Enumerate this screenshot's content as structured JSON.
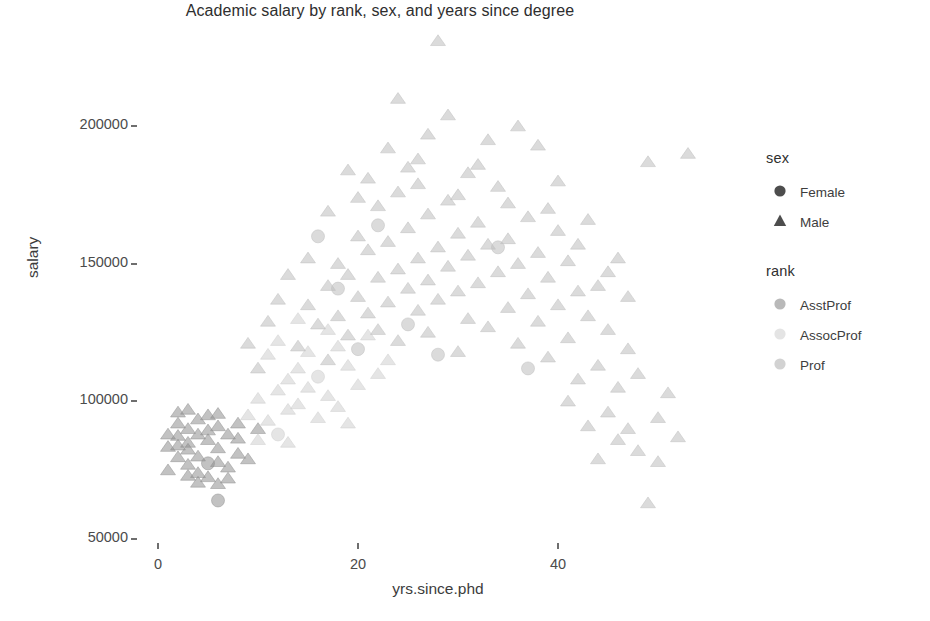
{
  "chart_data": {
    "type": "scatter",
    "title": "Academic salary by rank, sex, and years since degree",
    "xlabel": "yrs.since.phd",
    "ylabel": "salary",
    "xlim": [
      -2,
      58
    ],
    "ylim": [
      46000,
      235000
    ],
    "grid": false,
    "x_ticks": [
      {
        "value": 0,
        "label": "0"
      },
      {
        "value": 20,
        "label": "20"
      },
      {
        "value": 40,
        "label": "40"
      }
    ],
    "y_ticks": [
      {
        "value": 50000,
        "label": "50000"
      },
      {
        "value": 100000,
        "label": "100000"
      },
      {
        "value": 150000,
        "label": "150000"
      },
      {
        "value": 200000,
        "label": "200000"
      }
    ],
    "legends": [
      {
        "title": "sex",
        "encoding": "shape",
        "entries": [
          {
            "label": "Female",
            "shape": "circle",
            "color": "#4d4d4d"
          },
          {
            "label": "Male",
            "shape": "triangle",
            "color": "#4d4d4d"
          }
        ]
      },
      {
        "title": "rank",
        "encoding": "color",
        "entries": [
          {
            "label": "AsstProf",
            "shape": "circle",
            "color": "#b9b9b9"
          },
          {
            "label": "AssocProf",
            "shape": "circle",
            "color": "#e4e4e4"
          },
          {
            "label": "Prof",
            "shape": "circle",
            "color": "#d2d2d2"
          }
        ]
      }
    ],
    "marker_opacity": 0.55,
    "marker_size": 13,
    "series": [
      {
        "name": "AsstProf",
        "color": "#8f8f8f",
        "points": [
          {
            "x": 1,
            "y": 88000,
            "sex": "Male"
          },
          {
            "x": 2,
            "y": 79750,
            "sex": "Male"
          },
          {
            "x": 2,
            "y": 92000,
            "sex": "Male"
          },
          {
            "x": 3,
            "y": 85000,
            "sex": "Male"
          },
          {
            "x": 3,
            "y": 77000,
            "sex": "Male"
          },
          {
            "x": 3,
            "y": 90000,
            "sex": "Male"
          },
          {
            "x": 4,
            "y": 74000,
            "sex": "Male"
          },
          {
            "x": 4,
            "y": 88000,
            "sex": "Male"
          },
          {
            "x": 4,
            "y": 80000,
            "sex": "Male"
          },
          {
            "x": 5,
            "y": 72500,
            "sex": "Male"
          },
          {
            "x": 5,
            "y": 86000,
            "sex": "Male"
          },
          {
            "x": 5,
            "y": 95000,
            "sex": "Male"
          },
          {
            "x": 5,
            "y": 77500,
            "sex": "Female"
          },
          {
            "x": 6,
            "y": 83000,
            "sex": "Male"
          },
          {
            "x": 6,
            "y": 91000,
            "sex": "Male"
          },
          {
            "x": 6,
            "y": 70000,
            "sex": "Male"
          },
          {
            "x": 6,
            "y": 64000,
            "sex": "Female"
          },
          {
            "x": 7,
            "y": 88000,
            "sex": "Male"
          },
          {
            "x": 7,
            "y": 76000,
            "sex": "Male"
          },
          {
            "x": 8,
            "y": 92000,
            "sex": "Male"
          },
          {
            "x": 8,
            "y": 81000,
            "sex": "Male"
          },
          {
            "x": 2,
            "y": 96000,
            "sex": "Male"
          },
          {
            "x": 3,
            "y": 73000,
            "sex": "Male"
          },
          {
            "x": 4,
            "y": 93500,
            "sex": "Male"
          },
          {
            "x": 1,
            "y": 75000,
            "sex": "Male"
          },
          {
            "x": 2,
            "y": 84000,
            "sex": "Male"
          },
          {
            "x": 7,
            "y": 72000,
            "sex": "Male"
          },
          {
            "x": 5,
            "y": 89500,
            "sex": "Male"
          },
          {
            "x": 6,
            "y": 78000,
            "sex": "Male"
          },
          {
            "x": 4,
            "y": 70500,
            "sex": "Male"
          },
          {
            "x": 3,
            "y": 82500,
            "sex": "Male"
          },
          {
            "x": 8,
            "y": 86500,
            "sex": "Male"
          },
          {
            "x": 2,
            "y": 87500,
            "sex": "Male"
          },
          {
            "x": 9,
            "y": 79000,
            "sex": "Male"
          },
          {
            "x": 1,
            "y": 83500,
            "sex": "Male"
          },
          {
            "x": 10,
            "y": 90000,
            "sex": "Male"
          },
          {
            "x": 6,
            "y": 95500,
            "sex": "Male"
          },
          {
            "x": 3,
            "y": 97000,
            "sex": "Male"
          }
        ]
      },
      {
        "name": "AssocProf",
        "color": "#cfcfcf",
        "points": [
          {
            "x": 9,
            "y": 95000,
            "sex": "Male"
          },
          {
            "x": 10,
            "y": 101000,
            "sex": "Male"
          },
          {
            "x": 11,
            "y": 93000,
            "sex": "Male"
          },
          {
            "x": 12,
            "y": 104000,
            "sex": "Male"
          },
          {
            "x": 12,
            "y": 88000,
            "sex": "Female"
          },
          {
            "x": 13,
            "y": 108000,
            "sex": "Male"
          },
          {
            "x": 13,
            "y": 97000,
            "sex": "Male"
          },
          {
            "x": 14,
            "y": 112000,
            "sex": "Male"
          },
          {
            "x": 14,
            "y": 99000,
            "sex": "Male"
          },
          {
            "x": 15,
            "y": 105000,
            "sex": "Male"
          },
          {
            "x": 15,
            "y": 118000,
            "sex": "Male"
          },
          {
            "x": 16,
            "y": 94000,
            "sex": "Male"
          },
          {
            "x": 16,
            "y": 109000,
            "sex": "Female"
          },
          {
            "x": 17,
            "y": 102000,
            "sex": "Male"
          },
          {
            "x": 18,
            "y": 120000,
            "sex": "Male"
          },
          {
            "x": 18,
            "y": 98000,
            "sex": "Male"
          },
          {
            "x": 19,
            "y": 113000,
            "sex": "Male"
          },
          {
            "x": 20,
            "y": 106000,
            "sex": "Male"
          },
          {
            "x": 21,
            "y": 124000,
            "sex": "Male"
          },
          {
            "x": 22,
            "y": 110000,
            "sex": "Male"
          },
          {
            "x": 11,
            "y": 117000,
            "sex": "Male"
          },
          {
            "x": 13,
            "y": 85000,
            "sex": "Male"
          },
          {
            "x": 17,
            "y": 126000,
            "sex": "Male"
          },
          {
            "x": 19,
            "y": 92000,
            "sex": "Male"
          },
          {
            "x": 12,
            "y": 122000,
            "sex": "Male"
          },
          {
            "x": 23,
            "y": 115000,
            "sex": "Male"
          },
          {
            "x": 10,
            "y": 86000,
            "sex": "Male"
          },
          {
            "x": 14,
            "y": 130000,
            "sex": "Male"
          }
        ]
      },
      {
        "name": "Prof",
        "color": "#bdbdbd",
        "points": [
          {
            "x": 14,
            "y": 120000,
            "sex": "Male"
          },
          {
            "x": 15,
            "y": 135000,
            "sex": "Male"
          },
          {
            "x": 16,
            "y": 128000,
            "sex": "Male"
          },
          {
            "x": 17,
            "y": 142000,
            "sex": "Male"
          },
          {
            "x": 17,
            "y": 115000,
            "sex": "Male"
          },
          {
            "x": 18,
            "y": 150000,
            "sex": "Male"
          },
          {
            "x": 18,
            "y": 131000,
            "sex": "Male"
          },
          {
            "x": 19,
            "y": 124000,
            "sex": "Male"
          },
          {
            "x": 19,
            "y": 146000,
            "sex": "Male"
          },
          {
            "x": 20,
            "y": 138000,
            "sex": "Male"
          },
          {
            "x": 20,
            "y": 119000,
            "sex": "Female"
          },
          {
            "x": 20,
            "y": 160000,
            "sex": "Male"
          },
          {
            "x": 21,
            "y": 132000,
            "sex": "Male"
          },
          {
            "x": 21,
            "y": 155000,
            "sex": "Male"
          },
          {
            "x": 22,
            "y": 126000,
            "sex": "Male"
          },
          {
            "x": 22,
            "y": 145000,
            "sex": "Male"
          },
          {
            "x": 22,
            "y": 171000,
            "sex": "Male"
          },
          {
            "x": 23,
            "y": 136000,
            "sex": "Male"
          },
          {
            "x": 23,
            "y": 158000,
            "sex": "Male"
          },
          {
            "x": 24,
            "y": 122000,
            "sex": "Male"
          },
          {
            "x": 24,
            "y": 148000,
            "sex": "Male"
          },
          {
            "x": 24,
            "y": 176000,
            "sex": "Male"
          },
          {
            "x": 25,
            "y": 141000,
            "sex": "Male"
          },
          {
            "x": 25,
            "y": 163000,
            "sex": "Male"
          },
          {
            "x": 25,
            "y": 128000,
            "sex": "Female"
          },
          {
            "x": 26,
            "y": 152000,
            "sex": "Male"
          },
          {
            "x": 26,
            "y": 133000,
            "sex": "Male"
          },
          {
            "x": 26,
            "y": 188000,
            "sex": "Male"
          },
          {
            "x": 27,
            "y": 144000,
            "sex": "Male"
          },
          {
            "x": 27,
            "y": 168000,
            "sex": "Male"
          },
          {
            "x": 27,
            "y": 125000,
            "sex": "Male"
          },
          {
            "x": 28,
            "y": 156000,
            "sex": "Male"
          },
          {
            "x": 28,
            "y": 137000,
            "sex": "Male"
          },
          {
            "x": 29,
            "y": 149000,
            "sex": "Male"
          },
          {
            "x": 29,
            "y": 173000,
            "sex": "Male"
          },
          {
            "x": 29,
            "y": 204000,
            "sex": "Male"
          },
          {
            "x": 30,
            "y": 140000,
            "sex": "Male"
          },
          {
            "x": 30,
            "y": 161000,
            "sex": "Male"
          },
          {
            "x": 30,
            "y": 118000,
            "sex": "Male"
          },
          {
            "x": 31,
            "y": 153000,
            "sex": "Male"
          },
          {
            "x": 31,
            "y": 130000,
            "sex": "Male"
          },
          {
            "x": 32,
            "y": 165000,
            "sex": "Male"
          },
          {
            "x": 32,
            "y": 143000,
            "sex": "Male"
          },
          {
            "x": 33,
            "y": 127000,
            "sex": "Male"
          },
          {
            "x": 33,
            "y": 157000,
            "sex": "Male"
          },
          {
            "x": 34,
            "y": 147000,
            "sex": "Male"
          },
          {
            "x": 34,
            "y": 178000,
            "sex": "Male"
          },
          {
            "x": 35,
            "y": 134000,
            "sex": "Male"
          },
          {
            "x": 35,
            "y": 159000,
            "sex": "Male"
          },
          {
            "x": 36,
            "y": 121000,
            "sex": "Male"
          },
          {
            "x": 36,
            "y": 150000,
            "sex": "Male"
          },
          {
            "x": 37,
            "y": 139000,
            "sex": "Male"
          },
          {
            "x": 37,
            "y": 167000,
            "sex": "Male"
          },
          {
            "x": 38,
            "y": 129000,
            "sex": "Male"
          },
          {
            "x": 38,
            "y": 154000,
            "sex": "Male"
          },
          {
            "x": 39,
            "y": 116000,
            "sex": "Male"
          },
          {
            "x": 39,
            "y": 145000,
            "sex": "Male"
          },
          {
            "x": 40,
            "y": 135000,
            "sex": "Male"
          },
          {
            "x": 40,
            "y": 162000,
            "sex": "Male"
          },
          {
            "x": 41,
            "y": 123000,
            "sex": "Male"
          },
          {
            "x": 41,
            "y": 151000,
            "sex": "Male"
          },
          {
            "x": 42,
            "y": 108000,
            "sex": "Male"
          },
          {
            "x": 42,
            "y": 140000,
            "sex": "Male"
          },
          {
            "x": 43,
            "y": 131000,
            "sex": "Male"
          },
          {
            "x": 44,
            "y": 113000,
            "sex": "Male"
          },
          {
            "x": 44,
            "y": 142000,
            "sex": "Male"
          },
          {
            "x": 45,
            "y": 96000,
            "sex": "Male"
          },
          {
            "x": 45,
            "y": 126000,
            "sex": "Male"
          },
          {
            "x": 46,
            "y": 105000,
            "sex": "Male"
          },
          {
            "x": 47,
            "y": 90000,
            "sex": "Male"
          },
          {
            "x": 47,
            "y": 119000,
            "sex": "Male"
          },
          {
            "x": 48,
            "y": 110000,
            "sex": "Male"
          },
          {
            "x": 49,
            "y": 63000,
            "sex": "Male"
          },
          {
            "x": 50,
            "y": 94000,
            "sex": "Male"
          },
          {
            "x": 51,
            "y": 103000,
            "sex": "Male"
          },
          {
            "x": 53,
            "y": 190000,
            "sex": "Male"
          },
          {
            "x": 49,
            "y": 187000,
            "sex": "Male"
          },
          {
            "x": 33,
            "y": 195000,
            "sex": "Male"
          },
          {
            "x": 36,
            "y": 200000,
            "sex": "Male"
          },
          {
            "x": 38,
            "y": 193000,
            "sex": "Male"
          },
          {
            "x": 28,
            "y": 231000,
            "sex": "Male"
          },
          {
            "x": 24,
            "y": 210000,
            "sex": "Male"
          },
          {
            "x": 21,
            "y": 181000,
            "sex": "Male"
          },
          {
            "x": 23,
            "y": 192000,
            "sex": "Male"
          },
          {
            "x": 31,
            "y": 183000,
            "sex": "Male"
          },
          {
            "x": 35,
            "y": 172000,
            "sex": "Male"
          },
          {
            "x": 43,
            "y": 166000,
            "sex": "Male"
          },
          {
            "x": 46,
            "y": 152000,
            "sex": "Male"
          },
          {
            "x": 19,
            "y": 184000,
            "sex": "Male"
          },
          {
            "x": 26,
            "y": 179000,
            "sex": "Male"
          },
          {
            "x": 32,
            "y": 186000,
            "sex": "Male"
          },
          {
            "x": 40,
            "y": 180000,
            "sex": "Male"
          },
          {
            "x": 27,
            "y": 197000,
            "sex": "Male"
          },
          {
            "x": 30,
            "y": 175000,
            "sex": "Male"
          },
          {
            "x": 34,
            "y": 156000,
            "sex": "Female"
          },
          {
            "x": 22,
            "y": 164000,
            "sex": "Female"
          },
          {
            "x": 18,
            "y": 141000,
            "sex": "Female"
          },
          {
            "x": 28,
            "y": 117000,
            "sex": "Female"
          },
          {
            "x": 37,
            "y": 112000,
            "sex": "Female"
          },
          {
            "x": 16,
            "y": 160000,
            "sex": "Female"
          },
          {
            "x": 41,
            "y": 100000,
            "sex": "Male"
          },
          {
            "x": 13,
            "y": 146000,
            "sex": "Male"
          },
          {
            "x": 12,
            "y": 137000,
            "sex": "Male"
          },
          {
            "x": 11,
            "y": 129000,
            "sex": "Male"
          },
          {
            "x": 10,
            "y": 112000,
            "sex": "Male"
          },
          {
            "x": 9,
            "y": 121000,
            "sex": "Male"
          },
          {
            "x": 48,
            "y": 82000,
            "sex": "Male"
          },
          {
            "x": 52,
            "y": 87000,
            "sex": "Male"
          },
          {
            "x": 44,
            "y": 79000,
            "sex": "Male"
          },
          {
            "x": 46,
            "y": 86000,
            "sex": "Male"
          },
          {
            "x": 43,
            "y": 91000,
            "sex": "Male"
          },
          {
            "x": 50,
            "y": 78000,
            "sex": "Male"
          },
          {
            "x": 15,
            "y": 152000,
            "sex": "Male"
          },
          {
            "x": 17,
            "y": 169000,
            "sex": "Male"
          },
          {
            "x": 20,
            "y": 174000,
            "sex": "Male"
          },
          {
            "x": 25,
            "y": 185000,
            "sex": "Male"
          },
          {
            "x": 39,
            "y": 170000,
            "sex": "Male"
          },
          {
            "x": 42,
            "y": 157000,
            "sex": "Male"
          },
          {
            "x": 45,
            "y": 147000,
            "sex": "Male"
          },
          {
            "x": 47,
            "y": 138000,
            "sex": "Male"
          }
        ]
      }
    ]
  }
}
